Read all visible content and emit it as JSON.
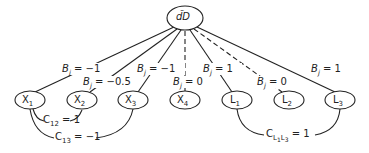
{
  "root": {
    "label": "d̃D"
  },
  "nodes": [
    {
      "id": "X1",
      "base": "X",
      "sub": "1"
    },
    {
      "id": "X2",
      "base": "X",
      "sub": "2"
    },
    {
      "id": "X3",
      "base": "X",
      "sub": "3"
    },
    {
      "id": "X4",
      "base": "X",
      "sub": "4"
    },
    {
      "id": "L1",
      "base": "L",
      "sub": "1"
    },
    {
      "id": "L2",
      "base": "L",
      "sub": "2"
    },
    {
      "id": "L3",
      "base": "L",
      "sub": "3"
    }
  ],
  "edges": [
    {
      "to": "X1",
      "label_var": "B",
      "label_sub": "j",
      "value": "= −1",
      "style": "solid"
    },
    {
      "to": "X2",
      "label_var": "B",
      "label_sub": "j",
      "value": "= −0.5",
      "style": "solid"
    },
    {
      "to": "X3",
      "label_var": "B",
      "label_sub": "j",
      "value": "= −1",
      "style": "solid"
    },
    {
      "to": "X4",
      "label_var": "B",
      "label_sub": "j",
      "value": "= 0",
      "style": "dashed"
    },
    {
      "to": "L1",
      "label_var": "B",
      "label_sub": "j",
      "value": "= 1",
      "style": "solid"
    },
    {
      "to": "L2",
      "label_var": "B",
      "label_sub": "j",
      "value": "= 0",
      "style": "dashed"
    },
    {
      "to": "L3",
      "label_var": "B",
      "label_sub": "j",
      "value": "= 1",
      "style": "solid"
    }
  ],
  "correlations": [
    {
      "between": [
        "X1",
        "X2"
      ],
      "label_var": "C",
      "label_sub": "12",
      "value": "= 1"
    },
    {
      "between": [
        "X1",
        "X3"
      ],
      "label_var": "C",
      "label_sub": "13",
      "value": "= −1"
    },
    {
      "between": [
        "L1",
        "L3"
      ],
      "label_var": "C",
      "label_sub": "L1L3",
      "value": "= 1"
    }
  ]
}
